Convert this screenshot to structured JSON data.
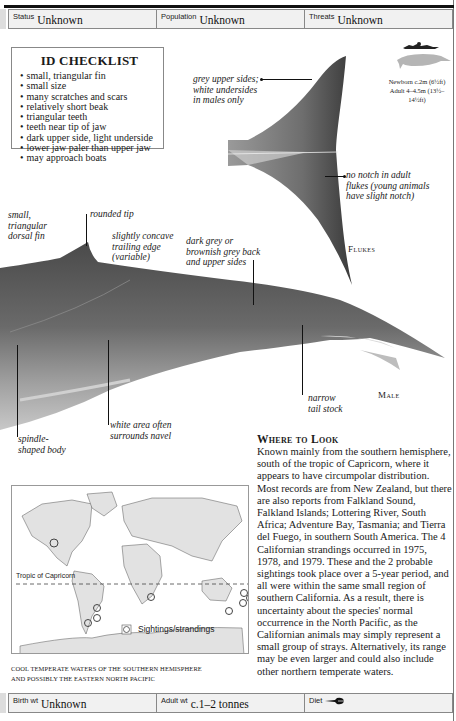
{
  "header": {
    "cells": [
      {
        "label": "Status",
        "value": "Unknown"
      },
      {
        "label": "Population",
        "value": "Unknown"
      },
      {
        "label": "Threats",
        "value": "Unknown"
      }
    ]
  },
  "checklist": {
    "title": "ID CHECKLIST",
    "items": [
      "small, triangular fin",
      "small size",
      "many scratches and scars",
      "relatively short beak",
      "triangular teeth",
      "teeth near tip of jaw",
      "dark upper side, light underside",
      "lower jaw paler than upper jaw",
      "may approach boats"
    ]
  },
  "size": {
    "newborn": "Newborn c.2m (6½ft)",
    "adult": "Adult 4–4.5m (13½–14½ft)"
  },
  "flukes": {
    "annotations": {
      "upper": [
        "grey upper sides;",
        "white undersides",
        "in males only"
      ],
      "notch": [
        "no notch in adult",
        "flukes (young animals",
        "have slight notch)"
      ]
    },
    "caption": "Flukes"
  },
  "body": {
    "annotations": {
      "dorsal": [
        "small,",
        "triangular",
        "dorsal fin"
      ],
      "tip": "rounded tip",
      "trailing": [
        "slightly concave",
        "trailing edge",
        "(variable)"
      ],
      "back": [
        "dark grey or",
        "brownish grey back",
        "and upper sides"
      ],
      "tailstock": [
        "narrow",
        "tail stock"
      ],
      "navel": [
        "white area often",
        "surrounds navel"
      ],
      "spindle": [
        "spindle-",
        "shaped body"
      ]
    },
    "caption": "Male"
  },
  "where_to_look": {
    "title": "Where to Look",
    "text": "Known mainly from the southern hemisphere, south of the tropic of Capricorn, where it appears to have circumpolar distribution. Most records are from New Zealand, but there are also reports from Falkland Sound, Falkland Islands; Lottering River, South Africa; Adventure Bay, Tasmania; and Tierra del Fuego, in southern South America. The 4 Californian strandings occurred in 1975, 1978, and 1979. These and the 2 probable sightings took place over a 5-year period, and all were within the same small region of southern California. As a result, there is uncertainty about the species' normal occurrence in the North Pacific, as the Californian animals may simply represent a small group of strays. Alternatively, its range may be even larger and could also include other northern temperate waters."
  },
  "map": {
    "tropic_label": "Tropic of Capricorn",
    "legend_label": "Sightings/strandings",
    "caption_line1": "COOL TEMPERATE WATERS OF THE SOUTHERN HEMISPHERE",
    "caption_line2": "AND POSSIBLY THE  EASTERN NORTH PACIFIC"
  },
  "footer": {
    "cells": [
      {
        "label": "Birth wt",
        "value": "Unknown"
      },
      {
        "label": "Adult wt",
        "value": "c.1–2 tonnes"
      },
      {
        "label": "Diet",
        "icon": "fish-icon"
      }
    ]
  }
}
